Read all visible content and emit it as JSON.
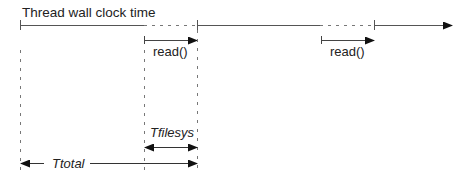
{
  "diagram": {
    "title": "Thread wall clock time",
    "calls": [
      {
        "label": "read()"
      },
      {
        "label": "read()"
      }
    ],
    "intervals": {
      "filesys": "Tfilesys",
      "total": "Ttotal"
    },
    "colors": {
      "line": "#444444",
      "dashed": "#777777",
      "text": "#222222"
    }
  }
}
